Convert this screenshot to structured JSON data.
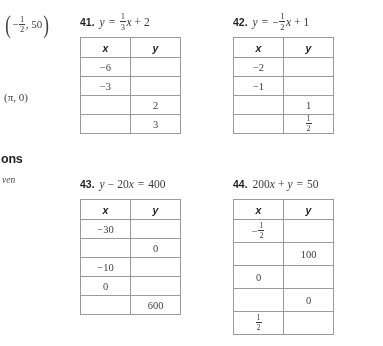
{
  "margin": {
    "answers": [
      {
        "id": "answer-coordinate-pair",
        "type": "coordinate",
        "x_num": "1",
        "x_den": "2",
        "x_negative": true,
        "y": "50",
        "text": "(-1/2, 50)"
      },
      {
        "id": "answer-pi-pair",
        "type": "plain",
        "text": "(π, 0)"
      }
    ],
    "heading_fragment": "ons",
    "subheading_fragment": "ven"
  },
  "exercises": [
    {
      "number": "41.",
      "equation_text": "y = 1/3 x + 2",
      "equation": {
        "lhs": "y",
        "eq": "=",
        "coef_num": "1",
        "coef_den": "3",
        "coef_negative": false,
        "variable": "x",
        "op": "+",
        "constant": "2"
      },
      "table": {
        "headers": [
          "x",
          "y"
        ],
        "rows": [
          {
            "x": "-6",
            "y": ""
          },
          {
            "x": "-3",
            "y": ""
          },
          {
            "x": "",
            "y": "2"
          },
          {
            "x": "",
            "y": "3"
          }
        ]
      }
    },
    {
      "number": "42.",
      "equation_text": "y = -1/2 x + 1",
      "equation": {
        "lhs": "y",
        "eq": "=",
        "coef_num": "1",
        "coef_den": "2",
        "coef_negative": true,
        "variable": "x",
        "op": "+",
        "constant": "1"
      },
      "table": {
        "headers": [
          "x",
          "y"
        ],
        "rows": [
          {
            "x": "-2",
            "y": ""
          },
          {
            "x": "-1",
            "y": ""
          },
          {
            "x": "",
            "y": "1"
          },
          {
            "x": "",
            "y": "1/2",
            "y_num": "1",
            "y_den": "2"
          }
        ]
      }
    },
    {
      "number": "43.",
      "equation_text": "y - 20x = 400",
      "equation": {
        "lhs": "y",
        "op": "-",
        "term": "20",
        "variable": "x",
        "eq": "=",
        "rhs": "400"
      },
      "table": {
        "headers": [
          "x",
          "y"
        ],
        "rows": [
          {
            "x": "-30",
            "y": ""
          },
          {
            "x": "",
            "y": "0"
          },
          {
            "x": "-10",
            "y": ""
          },
          {
            "x": "0",
            "y": ""
          },
          {
            "x": "",
            "y": "600"
          }
        ]
      }
    },
    {
      "number": "44.",
      "equation_text": "200x + y = 50",
      "equation": {
        "term": "200",
        "variable": "x",
        "op": "+",
        "lhs": "y",
        "eq": "=",
        "rhs": "50"
      },
      "table": {
        "headers": [
          "x",
          "y"
        ],
        "rows": [
          {
            "x": "-1/2",
            "x_num": "1",
            "x_den": "2",
            "x_negative": true,
            "y": ""
          },
          {
            "x": "",
            "y": "100"
          },
          {
            "x": "0",
            "y": ""
          },
          {
            "x": "",
            "y": "0"
          },
          {
            "x": "1/2",
            "x_num": "1",
            "x_den": "2",
            "x_negative": false,
            "y": ""
          }
        ]
      }
    }
  ]
}
